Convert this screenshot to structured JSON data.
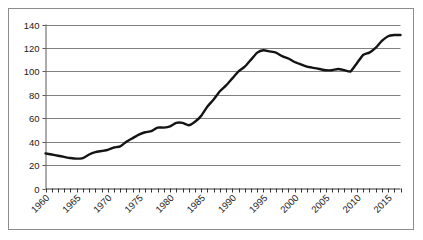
{
  "chart_data": {
    "type": "line",
    "title": "",
    "subtitle": "",
    "xlabel": "",
    "ylabel": "",
    "xlim": [
      1960,
      2017
    ],
    "ylim": [
      0,
      140
    ],
    "y_ticks": [
      0,
      20,
      40,
      60,
      80,
      100,
      120,
      140
    ],
    "x_tick_labels": [
      "1960",
      "1965",
      "1970",
      "1975",
      "1980",
      "1985",
      "1990",
      "1995",
      "2000",
      "2005",
      "2010",
      "2015"
    ],
    "x_tick_label_years": [
      1960,
      1965,
      1970,
      1975,
      1980,
      1985,
      1990,
      1995,
      2000,
      2005,
      2010,
      2015
    ],
    "x_tick_label_rotation": "-45",
    "minor_x_tick_interval": 1,
    "grid": "horizontal",
    "legend": "none",
    "legend_position": "none",
    "line_color": "#141414",
    "grid_color": "#808080",
    "axis_color": "#595959",
    "border_color": "#8c8c8c",
    "background_color": "#ffffff",
    "line_width": 2.4,
    "x": [
      1960,
      1961,
      1962,
      1963,
      1964,
      1965,
      1966,
      1967,
      1968,
      1969,
      1970,
      1971,
      1972,
      1973,
      1974,
      1975,
      1976,
      1977,
      1978,
      1979,
      1980,
      1981,
      1982,
      1983,
      1984,
      1985,
      1986,
      1987,
      1988,
      1989,
      1990,
      1991,
      1992,
      1993,
      1994,
      1995,
      1996,
      1997,
      1998,
      1999,
      2000,
      2001,
      2002,
      2003,
      2004,
      2005,
      2006,
      2007,
      2008,
      2009,
      2010,
      2011,
      2012,
      2013,
      2014,
      2015,
      2016,
      2017
    ],
    "values": [
      30,
      29,
      28,
      27,
      26,
      25.5,
      26,
      29,
      31,
      32,
      33,
      35,
      36,
      40,
      43,
      46,
      48,
      49,
      52,
      52,
      53,
      56,
      56,
      54,
      57,
      62,
      70,
      76,
      83,
      88,
      94,
      100,
      104,
      110,
      116,
      118,
      117,
      116,
      113,
      111,
      108,
      106,
      104,
      103,
      102,
      101,
      101,
      102,
      101,
      100,
      107,
      114,
      116,
      120,
      126,
      130,
      131,
      131
    ],
    "series": [
      {
        "name": "series-1",
        "values": [
          30,
          29,
          28,
          27,
          26,
          25.5,
          26,
          29,
          31,
          32,
          33,
          35,
          36,
          40,
          43,
          46,
          48,
          49,
          52,
          52,
          53,
          56,
          56,
          54,
          57,
          62,
          70,
          76,
          83,
          88,
          94,
          100,
          104,
          110,
          116,
          118,
          117,
          116,
          113,
          111,
          108,
          106,
          104,
          103,
          102,
          101,
          101,
          102,
          101,
          100,
          107,
          114,
          116,
          120,
          126,
          130,
          131,
          131
        ]
      }
    ]
  }
}
